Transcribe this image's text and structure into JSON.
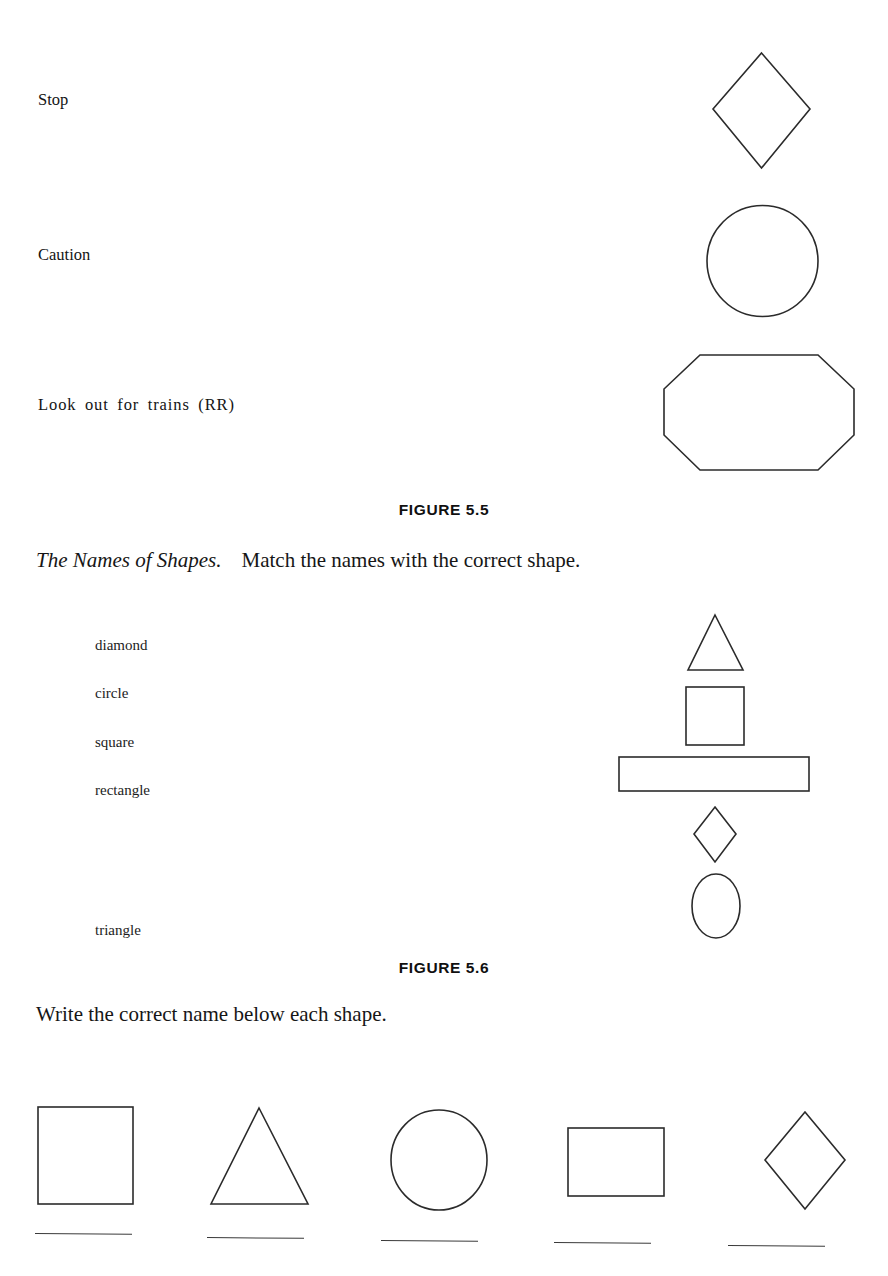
{
  "figure_5_5": {
    "caption": "FIGURE 5.5",
    "rows": [
      {
        "label": "Stop",
        "shape": "diamond"
      },
      {
        "label": "Caution",
        "shape": "circle"
      },
      {
        "label": "Look out for trains (RR)",
        "shape": "octagon"
      }
    ]
  },
  "exercise_names_of_shapes": {
    "title": "The Names of Shapes.",
    "instruction": "Match the names with the correct shape.",
    "words": [
      "diamond",
      "circle",
      "square",
      "rectangle",
      "triangle"
    ],
    "shapes": [
      "triangle",
      "square",
      "rectangle",
      "diamond",
      "circle"
    ]
  },
  "figure_5_6": {
    "caption": "FIGURE 5.6"
  },
  "exercise_write_names": {
    "instruction": "Write the correct name below each shape.",
    "shapes": [
      "square",
      "triangle",
      "circle",
      "rectangle",
      "diamond"
    ],
    "answers": [
      "",
      "",
      "",
      "",
      ""
    ]
  },
  "colors": {
    "page_background": "#ffffff",
    "ink": "#1a1a1a",
    "shape_stroke": "#2b2b2b"
  }
}
